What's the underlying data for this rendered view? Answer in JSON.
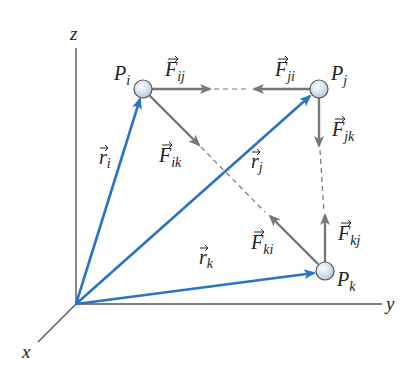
{
  "diagram": {
    "colors": {
      "axis": "#555555",
      "position_vector": "#2b73c4",
      "force": "#777777",
      "dashed": "#777777",
      "particle_fill": "#dfe8f5",
      "particle_stroke": "#555555",
      "label": "#222222"
    },
    "axes": {
      "z": "z",
      "y": "y",
      "x": "x"
    },
    "particles": [
      {
        "id": "Pi",
        "label": "P",
        "sub": "i"
      },
      {
        "id": "Pj",
        "label": "P",
        "sub": "j"
      },
      {
        "id": "Pk",
        "label": "P",
        "sub": "k"
      }
    ],
    "position_vectors": [
      {
        "label": "r",
        "sub": "i"
      },
      {
        "label": "r",
        "sub": "j"
      },
      {
        "label": "r",
        "sub": "k"
      }
    ],
    "forces": [
      {
        "label": "F",
        "sub": "ij"
      },
      {
        "label": "F",
        "sub": "ji"
      },
      {
        "label": "F",
        "sub": "ik"
      },
      {
        "label": "F",
        "sub": "jk"
      },
      {
        "label": "F",
        "sub": "ki"
      },
      {
        "label": "F",
        "sub": "kj"
      }
    ]
  }
}
